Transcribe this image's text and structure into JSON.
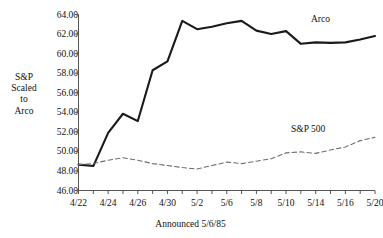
{
  "chart_data": {
    "type": "line",
    "title": "",
    "xlabel": "Announced 5/6/85",
    "ylabel": "S&P Scaled to Arco",
    "ylabel_lines": [
      "S&P",
      "Scaled",
      "to",
      "Arco"
    ],
    "ylim": [
      46.0,
      64.0
    ],
    "yticks": [
      46.0,
      48.0,
      50.0,
      52.0,
      54.0,
      56.0,
      58.0,
      60.0,
      62.0,
      64.0
    ],
    "ytick_labels": [
      "46.00",
      "48.00",
      "50.00",
      "52.00",
      "54.00",
      "56.00",
      "58.00",
      "60.00",
      "62.00",
      "64.00"
    ],
    "grid": false,
    "legend_position": "inline-right",
    "x": [
      "4/22",
      "4/23",
      "4/24",
      "4/25",
      "4/26",
      "4/29",
      "4/30",
      "5/1",
      "5/2",
      "5/3",
      "5/6",
      "5/7",
      "5/8",
      "5/9",
      "5/10",
      "5/13",
      "5/14",
      "5/15",
      "5/16",
      "5/17",
      "5/20"
    ],
    "xtick_labels_shown": [
      "4/22",
      "4/24",
      "4/26",
      "4/30",
      "5/2",
      "5/6",
      "5/8",
      "5/10",
      "5/14",
      "5/16",
      "5/20"
    ],
    "xtick_labels_shown_index": [
      0,
      2,
      4,
      6,
      8,
      10,
      12,
      14,
      16,
      18,
      20
    ],
    "series": [
      {
        "name": "Arco",
        "style": "solid",
        "color": "#1a1a1a",
        "values": [
          48.65,
          48.5,
          51.9,
          53.85,
          53.1,
          58.3,
          59.2,
          63.35,
          62.5,
          62.75,
          63.1,
          63.35,
          62.35,
          62.0,
          62.3,
          61.0,
          61.15,
          61.1,
          61.15,
          61.45,
          61.8
        ]
      },
      {
        "name": "S&P 500",
        "style": "dashed",
        "color": "#6e6e6e",
        "values": [
          48.65,
          48.75,
          49.1,
          49.35,
          49.1,
          48.75,
          48.55,
          48.35,
          48.2,
          48.55,
          48.9,
          48.75,
          49.0,
          49.25,
          49.85,
          49.95,
          49.8,
          50.15,
          50.45,
          51.1,
          51.45
        ]
      }
    ],
    "annotations": [
      {
        "text": "Arco",
        "series": "Arco"
      },
      {
        "text": "S&P 500",
        "series": "S&P 500"
      }
    ]
  },
  "axis": {
    "y_title_lines": [
      "S&P",
      "Scaled",
      "to",
      "Arco"
    ],
    "x_title": "Announced 5/6/85"
  }
}
